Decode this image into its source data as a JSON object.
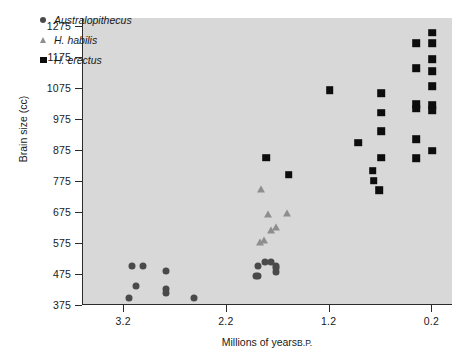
{
  "chart_data": {
    "type": "scatter",
    "title": "",
    "xlabel": "Millions of years B.P.",
    "ylabel": "Brain size (cc)",
    "xlim": [
      3.6,
      0.0
    ],
    "ylim": [
      375,
      1300
    ],
    "x_axis_reversed": true,
    "grid": false,
    "legend_position": "top-left",
    "xticks": [
      3.2,
      2.2,
      1.2,
      0.2
    ],
    "xtick_labels": [
      "3.2",
      "2.2",
      "1.2",
      "0.2"
    ],
    "yticks": [
      375,
      475,
      575,
      675,
      775,
      875,
      975,
      1075,
      1175,
      1275
    ],
    "ytick_labels": [
      "375",
      "475",
      "575",
      "675",
      "775",
      "875",
      "975",
      "1075",
      "1175",
      "1275"
    ],
    "plot_background": "#d8d8d8",
    "figure_background": "#ffffff",
    "series": [
      {
        "name": "Australopithecus",
        "marker": "circle",
        "color": "#4a4a4a",
        "points": [
          {
            "x": 3.12,
            "y": 500
          },
          {
            "x": 3.02,
            "y": 500
          },
          {
            "x": 3.08,
            "y": 435
          },
          {
            "x": 3.15,
            "y": 398
          },
          {
            "x": 2.79,
            "y": 483
          },
          {
            "x": 2.79,
            "y": 425
          },
          {
            "x": 2.79,
            "y": 415
          },
          {
            "x": 2.52,
            "y": 398
          },
          {
            "x": 1.9,
            "y": 500
          },
          {
            "x": 1.9,
            "y": 470
          },
          {
            "x": 1.92,
            "y": 467
          },
          {
            "x": 1.83,
            "y": 515
          },
          {
            "x": 1.77,
            "y": 513
          },
          {
            "x": 1.72,
            "y": 495
          },
          {
            "x": 1.72,
            "y": 482
          },
          {
            "x": 1.72,
            "y": 502
          }
        ]
      },
      {
        "name": "H. habilis",
        "marker": "triangle",
        "color": "#8e8e8e",
        "points": [
          {
            "x": 1.87,
            "y": 748
          },
          {
            "x": 1.8,
            "y": 668
          },
          {
            "x": 1.77,
            "y": 618
          },
          {
            "x": 1.88,
            "y": 578
          },
          {
            "x": 1.84,
            "y": 585
          },
          {
            "x": 1.62,
            "y": 670
          },
          {
            "x": 1.72,
            "y": 628
          }
        ]
      },
      {
        "name": "H. erectus",
        "marker": "square",
        "color": "#0d0d0d",
        "points": [
          {
            "x": 1.82,
            "y": 850
          },
          {
            "x": 1.6,
            "y": 795
          },
          {
            "x": 1.2,
            "y": 1068
          },
          {
            "x": 0.92,
            "y": 898
          },
          {
            "x": 0.78,
            "y": 808
          },
          {
            "x": 0.77,
            "y": 775
          },
          {
            "x": 0.7,
            "y": 1058
          },
          {
            "x": 0.7,
            "y": 995
          },
          {
            "x": 0.7,
            "y": 935
          },
          {
            "x": 0.7,
            "y": 850
          },
          {
            "x": 0.72,
            "y": 745
          },
          {
            "x": 0.36,
            "y": 1218
          },
          {
            "x": 0.36,
            "y": 1138
          },
          {
            "x": 0.36,
            "y": 1022
          },
          {
            "x": 0.36,
            "y": 1008
          },
          {
            "x": 0.36,
            "y": 910
          },
          {
            "x": 0.36,
            "y": 848
          },
          {
            "x": 0.2,
            "y": 1252
          },
          {
            "x": 0.2,
            "y": 1218
          },
          {
            "x": 0.2,
            "y": 1168
          },
          {
            "x": 0.2,
            "y": 1128
          },
          {
            "x": 0.2,
            "y": 1080
          },
          {
            "x": 0.2,
            "y": 1018
          },
          {
            "x": 0.2,
            "y": 1002
          },
          {
            "x": 0.2,
            "y": 872
          }
        ]
      }
    ]
  },
  "legend": {
    "items": [
      {
        "label": "Australopithecus",
        "marker": "circle"
      },
      {
        "label": "H. habilis",
        "marker": "triangle"
      },
      {
        "label": "H. erectus",
        "marker": "square"
      }
    ]
  },
  "axis": {
    "x_title_main": "Millions of years",
    "x_title_suffix": "B.P."
  }
}
